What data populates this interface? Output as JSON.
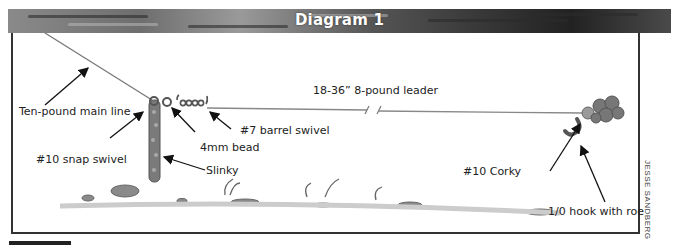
{
  "diagram": {
    "title": "Diagram 1",
    "credit": "JESSE SANDBERG",
    "labels": {
      "main_line": "Ten-pound main line",
      "leader": "18-36” 8-pound leader",
      "barrel_swivel": "#7 barrel swivel",
      "bead": "4mm bead",
      "snap_swivel": "#10 snap swivel",
      "slinky": "Slinky",
      "corky": "#10 Corky",
      "hook": "1/0 hook with roe"
    }
  }
}
